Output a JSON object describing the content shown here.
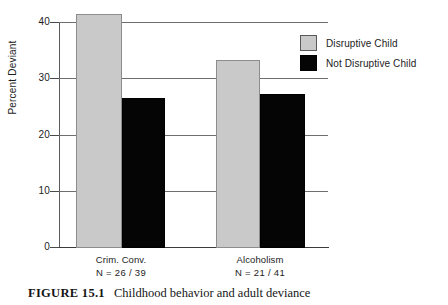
{
  "figure": {
    "number_label": "FIGURE 15.1",
    "caption": "Childhood behavior and adult deviance"
  },
  "colors": {
    "disruptive": "#c9c9c9",
    "not_disruptive": "#050505",
    "axis": "#3a3a3a",
    "grid": "#6e6e6e",
    "background": "#ffffff"
  },
  "legend": {
    "position": "top-right",
    "items": [
      {
        "label": "Disruptive Child",
        "swatch": "gray"
      },
      {
        "label": "Not Disruptive Child",
        "swatch": "black"
      }
    ]
  },
  "axes": {
    "y_title": "Percent Deviant",
    "y_ticks": [
      "0",
      "10",
      "20",
      "30",
      "40"
    ],
    "x_groups": [
      {
        "name": "Crim. Conv.",
        "n_label": "N = 26 / 39"
      },
      {
        "name": "Alcoholism",
        "n_label": "N = 21 / 41"
      }
    ]
  },
  "chart_data": {
    "type": "bar",
    "title": "Childhood behavior and adult deviance",
    "xlabel": "",
    "ylabel": "Percent Deviant",
    "ylim": [
      0,
      42
    ],
    "yticks": [
      0,
      10,
      20,
      30,
      40
    ],
    "grid": true,
    "legend_position": "top-right",
    "categories": [
      "Crim. Conv.",
      "Alcoholism"
    ],
    "category_annotations": [
      "N = 26 / 39",
      "N = 21 / 41"
    ],
    "series": [
      {
        "name": "Disruptive Child",
        "color": "#c9c9c9",
        "values": [
          41.5,
          33.3
        ]
      },
      {
        "name": "Not Disruptive Child",
        "color": "#050505",
        "values": [
          26.6,
          27.3
        ]
      }
    ]
  }
}
